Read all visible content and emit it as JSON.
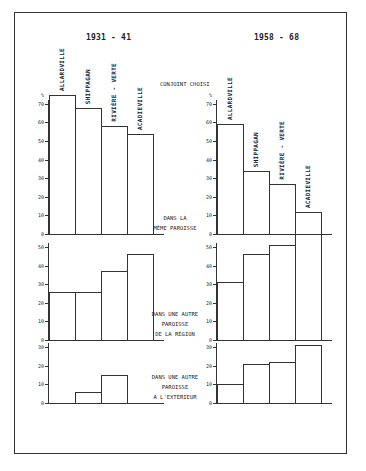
{
  "periods": {
    "left": "1931 - 41",
    "right": "1958 - 68"
  },
  "header_label": "CONJOINT CHOISI",
  "unit": "%",
  "categories": [
    "ALLARDVILLE",
    "SHIPPAGAN",
    "RIVIÈRE - VERTE",
    "ACADIEVILLE"
  ],
  "sections": [
    {
      "label_lines": [
        "DANS LA",
        "MÊME PAROISSE"
      ]
    },
    {
      "label_lines": [
        "DANS UNE AUTRE",
        "PAROISSE",
        "DE LA RÉGION"
      ]
    },
    {
      "label_lines": [
        "DANS UNE AUTRE",
        "PAROISSE",
        "À L'EXTÉRIEUR"
      ]
    }
  ],
  "ticks": {
    "top": [
      "0",
      "10",
      "20",
      "30",
      "40",
      "50",
      "60",
      "70"
    ],
    "middle": [
      "0",
      "10",
      "20",
      "30",
      "40",
      "50"
    ],
    "bottom": [
      "0",
      "10",
      "20",
      "30"
    ]
  },
  "chart_data": [
    {
      "type": "bar",
      "title": "1931 - 41",
      "subtitle": "Conjoint choisi dans la même paroisse",
      "categories": [
        "Allardville",
        "Shippagan",
        "Rivière-Verte",
        "Acadieville"
      ],
      "values": [
        75,
        68,
        58,
        54
      ],
      "ylabel": "%",
      "ylim": [
        0,
        70
      ]
    },
    {
      "type": "bar",
      "title": "1958 - 68",
      "subtitle": "Conjoint choisi dans la même paroisse",
      "categories": [
        "Allardville",
        "Shippagan",
        "Rivière-Verte",
        "Acadieville"
      ],
      "values": [
        59,
        34,
        27,
        12
      ],
      "ylabel": "%",
      "ylim": [
        0,
        70
      ]
    },
    {
      "type": "bar",
      "title": "1931 - 41",
      "subtitle": "Dans une autre paroisse de la région",
      "categories": [
        "Allardville",
        "Shippagan",
        "Rivière-Verte",
        "Acadieville"
      ],
      "values": [
        26,
        26,
        37,
        46
      ],
      "ylabel": "%",
      "ylim": [
        0,
        50
      ]
    },
    {
      "type": "bar",
      "title": "1958 - 68",
      "subtitle": "Dans une autre paroisse de la région",
      "categories": [
        "Allardville",
        "Shippagan",
        "Rivière-Verte",
        "Acadieville"
      ],
      "values": [
        31,
        46,
        51,
        57
      ],
      "ylabel": "%",
      "ylim": [
        0,
        50
      ]
    },
    {
      "type": "bar",
      "title": "1931 - 41",
      "subtitle": "Dans une autre paroisse à l'extérieur",
      "categories": [
        "Allardville",
        "Shippagan",
        "Rivière-Verte",
        "Acadieville"
      ],
      "values": [
        0,
        6,
        15,
        0
      ],
      "ylabel": "%",
      "ylim": [
        0,
        30
      ]
    },
    {
      "type": "bar",
      "title": "1958 - 68",
      "subtitle": "Dans une autre paroisse à l'extérieur",
      "categories": [
        "Allardville",
        "Shippagan",
        "Rivière-Verte",
        "Acadieville"
      ],
      "values": [
        10,
        21,
        22,
        31
      ],
      "ylabel": "%",
      "ylim": [
        0,
        30
      ]
    }
  ]
}
